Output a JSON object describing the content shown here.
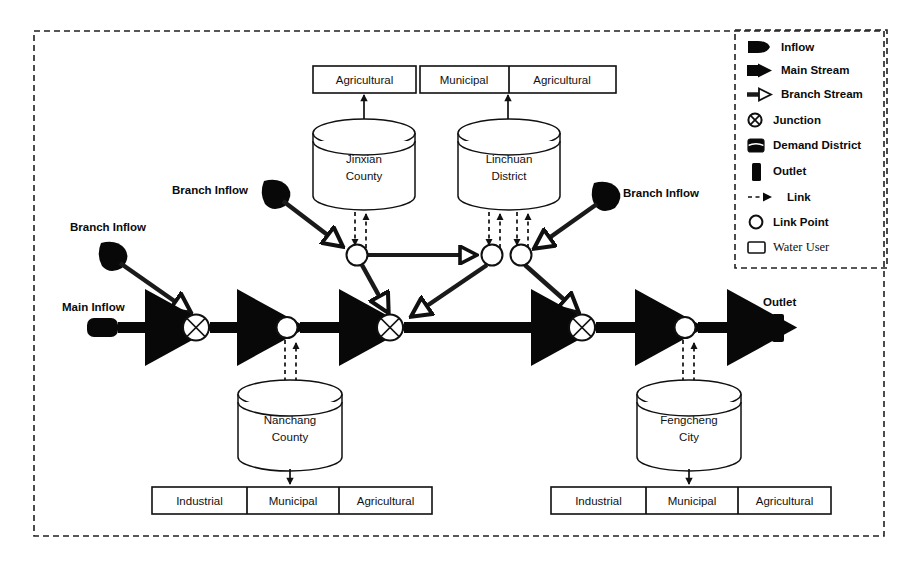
{
  "diagram": {
    "labels": {
      "main_inflow": "Main Inflow",
      "branch_inflow_1": "Branch Inflow",
      "branch_inflow_2": "Branch Inflow",
      "branch_inflow_3": "Branch Inflow",
      "outlet": "Outlet"
    },
    "demand_districts": [
      {
        "id": "jinxian",
        "name_line1": "Jinxian",
        "name_line2": "County"
      },
      {
        "id": "linchuan",
        "name_line1": "Linchuan",
        "name_line2": "District"
      },
      {
        "id": "nanchang",
        "name_line1": "Nanchang",
        "name_line2": "County"
      },
      {
        "id": "fengcheng",
        "name_line1": "Fengcheng",
        "name_line2": "City"
      }
    ],
    "water_users": {
      "jinxian": [
        "Agricultural"
      ],
      "linchuan": [
        "Municipal",
        "Agricultural"
      ],
      "nanchang": [
        "Industrial",
        "Municipal",
        "Agricultural"
      ],
      "fengcheng": [
        "Industrial",
        "Municipal",
        "Agricultural"
      ]
    }
  },
  "legend": {
    "items": [
      {
        "icon": "inflow-icon",
        "label": "Inflow"
      },
      {
        "icon": "main-stream-icon",
        "label": "Main Stream"
      },
      {
        "icon": "branch-stream-icon",
        "label": "Branch Stream"
      },
      {
        "icon": "junction-icon",
        "label": "Junction"
      },
      {
        "icon": "demand-district-icon",
        "label": "Demand District"
      },
      {
        "icon": "outlet-icon",
        "label": "Outlet"
      },
      {
        "icon": "link-icon",
        "label": "Link"
      },
      {
        "icon": "link-point-icon",
        "label": "Link Point"
      },
      {
        "icon": "water-user-icon",
        "label": "Water User"
      }
    ]
  },
  "colors": {
    "stroke": "#101010",
    "fill_dark": "#080808",
    "background": "#ffffff"
  }
}
